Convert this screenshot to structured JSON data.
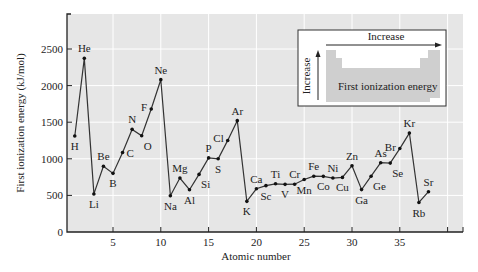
{
  "chart_data": {
    "type": "line",
    "title": "",
    "xlabel": "Atomic number",
    "ylabel": "First ionization energy (kJ/mol)",
    "xlim": [
      0,
      41
    ],
    "ylim": [
      0,
      2950
    ],
    "grid": true,
    "x_ticks": [
      5,
      10,
      15,
      20,
      25,
      30,
      35
    ],
    "y_ticks": [
      0,
      500,
      1000,
      1500,
      2000,
      2500
    ],
    "x": [
      1,
      2,
      3,
      4,
      5,
      6,
      7,
      8,
      9,
      10,
      11,
      12,
      13,
      14,
      15,
      16,
      17,
      18,
      19,
      20,
      21,
      22,
      23,
      24,
      25,
      26,
      27,
      28,
      29,
      30,
      31,
      32,
      33,
      34,
      35,
      36,
      37,
      38
    ],
    "series": [
      {
        "name": "First ionization energy",
        "values": [
          1312,
          2372,
          520,
          899,
          801,
          1086,
          1402,
          1314,
          1681,
          2081,
          496,
          738,
          578,
          787,
          1012,
          1000,
          1251,
          1521,
          419,
          590,
          633,
          659,
          651,
          653,
          717,
          762,
          760,
          737,
          746,
          906,
          579,
          762,
          947,
          941,
          1140,
          1351,
          403,
          550
        ]
      }
    ],
    "point_labels": [
      {
        "z": 1,
        "sym": "H",
        "pos": "below"
      },
      {
        "z": 2,
        "sym": "He",
        "pos": "above"
      },
      {
        "z": 3,
        "sym": "Li",
        "pos": "below"
      },
      {
        "z": 4,
        "sym": "Be",
        "pos": "above"
      },
      {
        "z": 5,
        "sym": "B",
        "pos": "below"
      },
      {
        "z": 6,
        "sym": "C",
        "pos": "right"
      },
      {
        "z": 7,
        "sym": "N",
        "pos": "above"
      },
      {
        "z": 8,
        "sym": "O",
        "pos": "belowright"
      },
      {
        "z": 9,
        "sym": "F",
        "pos": "left"
      },
      {
        "z": 10,
        "sym": "Ne",
        "pos": "above"
      },
      {
        "z": 11,
        "sym": "Na",
        "pos": "below"
      },
      {
        "z": 12,
        "sym": "Mg",
        "pos": "above"
      },
      {
        "z": 13,
        "sym": "Al",
        "pos": "below"
      },
      {
        "z": 14,
        "sym": "Si",
        "pos": "belowright"
      },
      {
        "z": 15,
        "sym": "P",
        "pos": "above"
      },
      {
        "z": 16,
        "sym": "S",
        "pos": "below"
      },
      {
        "z": 17,
        "sym": "Cl",
        "pos": "left"
      },
      {
        "z": 18,
        "sym": "Ar",
        "pos": "above"
      },
      {
        "z": 19,
        "sym": "K",
        "pos": "below"
      },
      {
        "z": 20,
        "sym": "Ca",
        "pos": "above"
      },
      {
        "z": 21,
        "sym": "Sc",
        "pos": "below"
      },
      {
        "z": 22,
        "sym": "Ti",
        "pos": "above"
      },
      {
        "z": 23,
        "sym": "V",
        "pos": "below"
      },
      {
        "z": 24,
        "sym": "Cr",
        "pos": "above"
      },
      {
        "z": 25,
        "sym": "Mn",
        "pos": "below"
      },
      {
        "z": 26,
        "sym": "Fe",
        "pos": "above"
      },
      {
        "z": 27,
        "sym": "Co",
        "pos": "below"
      },
      {
        "z": 28,
        "sym": "Ni",
        "pos": "above"
      },
      {
        "z": 29,
        "sym": "Cu",
        "pos": "below"
      },
      {
        "z": 30,
        "sym": "Zn",
        "pos": "above"
      },
      {
        "z": 31,
        "sym": "Ga",
        "pos": "below"
      },
      {
        "z": 32,
        "sym": "Ge",
        "pos": "belowright"
      },
      {
        "z": 33,
        "sym": "As",
        "pos": "above"
      },
      {
        "z": 34,
        "sym": "Se",
        "pos": "belowright"
      },
      {
        "z": 35,
        "sym": "Br",
        "pos": "left"
      },
      {
        "z": 36,
        "sym": "Kr",
        "pos": "above"
      },
      {
        "z": 37,
        "sym": "Rb",
        "pos": "below"
      },
      {
        "z": 38,
        "sym": "Sr",
        "pos": "above"
      }
    ],
    "inset": {
      "horizontal_label": "Increase",
      "vertical_label": "Increase",
      "caption": "First ionization energy"
    }
  },
  "colors": {
    "plot_background": "#e6e6e6",
    "grid": "#ffffff",
    "line": "#333333",
    "inset_shape": "#cfcfcf",
    "inset_background": "#ffffff"
  }
}
